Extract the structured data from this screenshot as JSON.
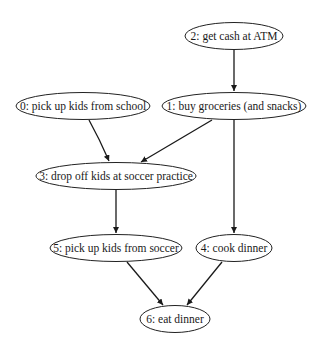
{
  "diagram": {
    "type": "directed-acyclic-graph",
    "nodes": [
      {
        "id": 0,
        "label": "0: pick up kids from school",
        "cx": 83,
        "cy": 106,
        "rx": 67,
        "ry": 13.5
      },
      {
        "id": 1,
        "label": "1: buy groceries (and snacks)",
        "cx": 234,
        "cy": 106,
        "rx": 72,
        "ry": 13.5
      },
      {
        "id": 2,
        "label": "2: get cash at ATM",
        "cx": 234,
        "cy": 36,
        "rx": 49,
        "ry": 13.5
      },
      {
        "id": 3,
        "label": "3: drop off kids at soccer practice",
        "cx": 116,
        "cy": 176,
        "rx": 80,
        "ry": 13.5
      },
      {
        "id": 4,
        "label": "4: cook dinner",
        "cx": 234,
        "cy": 248,
        "rx": 38,
        "ry": 13.5
      },
      {
        "id": 5,
        "label": "5: pick up kids from soccer",
        "cx": 116,
        "cy": 248,
        "rx": 66,
        "ry": 13.5
      },
      {
        "id": 6,
        "label": "6: eat dinner",
        "cx": 175,
        "cy": 319,
        "rx": 35,
        "ry": 13.5
      }
    ],
    "edges": [
      {
        "from": 2,
        "to": 1
      },
      {
        "from": 0,
        "to": 3
      },
      {
        "from": 1,
        "to": 3
      },
      {
        "from": 1,
        "to": 4
      },
      {
        "from": 3,
        "to": 5
      },
      {
        "from": 5,
        "to": 6
      },
      {
        "from": 4,
        "to": 6
      }
    ],
    "colors": {
      "stroke": "#222222",
      "text": "#1a1a1a",
      "background": "#ffffff"
    }
  }
}
